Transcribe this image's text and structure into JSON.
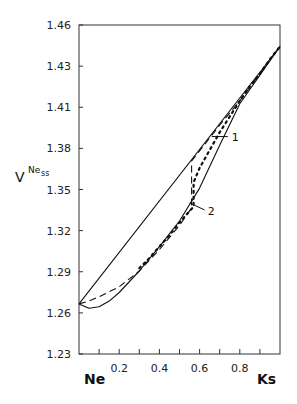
{
  "chart_data": {
    "type": "line",
    "title": "",
    "xlabel_left": "Ne",
    "xlabel_right": "Ks",
    "ylabel": "V",
    "ylabel_superscript": "Ne",
    "ylabel_subscript": "ss",
    "xlim": [
      0,
      1
    ],
    "ylim": [
      1.23,
      1.46
    ],
    "x_ticks": [
      0.1,
      0.2,
      0.3,
      0.4,
      0.5,
      0.6,
      0.7,
      0.8,
      0.9
    ],
    "x_tick_labels": [
      "0.2",
      "0.4",
      "0.6",
      "0.8"
    ],
    "x_tick_label_values": [
      0.2,
      0.4,
      0.6,
      0.8
    ],
    "y_tick_labels": [
      "1.46",
      "1.43",
      "1.41",
      "1.38",
      "1.35",
      "1.32",
      "1.29",
      "1.26",
      "1.23"
    ],
    "y_tick_values": [
      1.46,
      1.43125,
      1.4025,
      1.37375,
      1.345,
      1.31625,
      1.2875,
      1.25875,
      1.23
    ],
    "grid": false,
    "series": [
      {
        "name": "linear (ideal)",
        "style": "solid",
        "x": [
          0.0,
          1.0
        ],
        "y": [
          1.265,
          1.445
        ]
      },
      {
        "name": "lower solid curve",
        "style": "solid",
        "x": [
          0.0,
          0.05,
          0.1,
          0.15,
          0.2,
          0.3,
          0.4,
          0.5,
          0.6,
          0.7,
          0.8,
          0.9,
          1.0
        ],
        "y": [
          1.265,
          1.262,
          1.263,
          1.267,
          1.273,
          1.288,
          1.305,
          1.323,
          1.346,
          1.376,
          1.405,
          1.425,
          1.445
        ]
      },
      {
        "name": "1",
        "style": "dashed",
        "x": [
          0.0,
          0.05,
          0.1,
          0.2,
          0.3,
          0.4,
          0.5,
          0.56,
          0.56,
          0.6,
          0.7,
          0.8,
          0.9,
          1.0
        ],
        "y": [
          1.265,
          1.267,
          1.27,
          1.277,
          1.288,
          1.303,
          1.32,
          1.332,
          1.365,
          1.372,
          1.39,
          1.407,
          1.426,
          1.445
        ]
      },
      {
        "name": "2",
        "style": "dotted",
        "x": [
          0.3,
          0.35,
          0.4,
          0.45,
          0.5,
          0.55,
          0.57,
          0.57,
          0.6,
          0.7,
          0.8,
          0.85,
          0.9,
          0.95,
          1.0
        ],
        "y": [
          1.29,
          1.297,
          1.305,
          1.313,
          1.322,
          1.33,
          1.333,
          1.35,
          1.36,
          1.385,
          1.407,
          1.417,
          1.426,
          1.436,
          1.445
        ]
      }
    ],
    "annotations": [
      {
        "text": "1",
        "x": 0.76,
        "y": 1.382
      },
      {
        "text": "2",
        "x": 0.64,
        "y": 1.33
      }
    ]
  }
}
